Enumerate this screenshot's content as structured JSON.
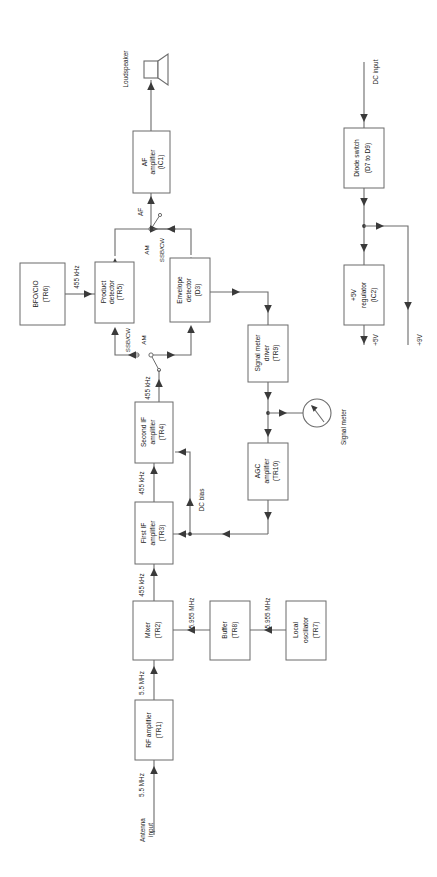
{
  "diagram": {
    "orientation": "rotated-90-ccw",
    "colors": {
      "background": "#ffffff",
      "box_stroke": "#6b6b6b",
      "wire": "#6b6b6b",
      "arrow": "#3a3a3a",
      "text": "#1a1a1a"
    },
    "blocks": [
      {
        "id": "bfo",
        "name": "bfo-cio-block",
        "line1": "BFO/CIO",
        "line2": "(TR6)"
      },
      {
        "id": "proddet",
        "name": "product-detector-block",
        "line1": "Product",
        "line2": "detector",
        "line3": "(TR5)"
      },
      {
        "id": "envdet",
        "name": "envelope-detector-block",
        "line1": "Envelope",
        "line2": "detector",
        "line3": "(D3)"
      },
      {
        "id": "afamp",
        "name": "af-amplifier-block",
        "line1": "AF",
        "line2": "amplifier",
        "line3": "(IC1)"
      },
      {
        "id": "secondif",
        "name": "second-if-amplifier-block",
        "line1": "Second IF",
        "line2": "amplifier",
        "line3": "(TR4)"
      },
      {
        "id": "firstif",
        "name": "first-if-amplifier-block",
        "line1": "First IF",
        "line2": "amplifier",
        "line3": "(TR3)"
      },
      {
        "id": "smdriver",
        "name": "signal-meter-driver-block",
        "line1": "Signal meter",
        "line2": "driver",
        "line3": "(TR9)"
      },
      {
        "id": "agcamp",
        "name": "agc-amplifier-block",
        "line1": "AGC",
        "line2": "amplifier",
        "line3": "(TR10)"
      },
      {
        "id": "mixer",
        "name": "mixer-block",
        "line1": "Mixer",
        "line2": "(TR2)"
      },
      {
        "id": "buffer",
        "name": "buffer-block",
        "line1": "Buffer",
        "line2": "(TR8)"
      },
      {
        "id": "localosc",
        "name": "local-oscillator-block",
        "line1": "Local",
        "line2": "oscillator",
        "line3": "(TR7)"
      },
      {
        "id": "rfamp",
        "name": "rf-amplifier-block",
        "line1": "RF amplifier",
        "line2": "(TR1)"
      },
      {
        "id": "diodesw",
        "name": "diode-switch-block",
        "line1": "Diode switch",
        "line2": "(D7 to D9)"
      },
      {
        "id": "reg5v",
        "name": "five-volt-regulator-block",
        "line1": "+5V",
        "line2": "regulator",
        "line3": "(IC2)"
      }
    ],
    "wire_labels": {
      "bfo_to_product": "455 kHz",
      "af_node": "AF",
      "ssbcw_upper": "SSB/CW",
      "am_upper": "AM",
      "ssbcw_lower": "SSB/CW",
      "am_lower": "AM",
      "secondif_out": "455 kHz",
      "firstif_to_secondif": "455 kHz",
      "mixer_to_firstif": "455 kHz",
      "dc_bias": "DC bias",
      "buffer_to_mixer": "5.955 MHz",
      "localosc_to_buffer": "5.955 MHz",
      "rf_to_mixer": "5.5 MHz",
      "antenna_to_rf": "5.5 MHz",
      "dc_input": "DC input",
      "rail_5v": "+5V",
      "rail_9v": "+9V"
    },
    "terminals": {
      "loudspeaker": "Loudspeaker",
      "antenna_input_l1": "Antenna",
      "antenna_input_l2": "input",
      "signal_meter": "Signal meter"
    },
    "icons": {
      "loudspeaker": "loudspeaker-icon",
      "signal_meter": "analog-meter-icon",
      "switch_ssb_am_upper": "toggle-switch-icon",
      "switch_ssb_am_lower": "toggle-switch-icon"
    }
  }
}
